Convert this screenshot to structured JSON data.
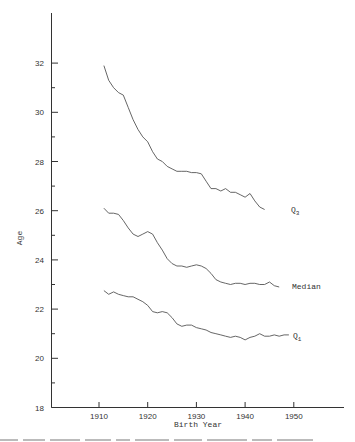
{
  "chart_data": {
    "type": "line",
    "title": "",
    "xlabel": "Birth Year",
    "ylabel": "Age",
    "xlim": [
      1902,
      1961
    ],
    "ylim": [
      18,
      34
    ],
    "x_ticks": [
      1910,
      1920,
      1930,
      1940,
      1950
    ],
    "y_ticks": [
      18,
      20,
      22,
      24,
      26,
      28,
      30,
      32
    ],
    "y_minor_ticks": [
      19,
      21,
      23,
      25,
      27,
      29,
      31
    ],
    "grid": false,
    "legend": "inline labels at right end of each series",
    "series": [
      {
        "name": "Q3",
        "label_main": "Q",
        "label_sub": "3",
        "x_start": 1911,
        "values": [
          31.9,
          31.3,
          31.0,
          30.8,
          30.7,
          30.2,
          29.7,
          29.3,
          29.0,
          28.8,
          28.4,
          28.1,
          28.0,
          27.8,
          27.7,
          27.6,
          27.6,
          27.6,
          27.55,
          27.55,
          27.5,
          27.2,
          26.9,
          26.9,
          26.8,
          26.9,
          26.75,
          26.75,
          26.65,
          26.55,
          26.7,
          26.4,
          26.15,
          26.05
        ]
      },
      {
        "name": "Median",
        "label_main": "Median",
        "label_sub": "",
        "x_start": 1911,
        "values": [
          26.1,
          25.9,
          25.9,
          25.85,
          25.6,
          25.3,
          25.05,
          24.95,
          25.05,
          25.15,
          25.05,
          24.7,
          24.4,
          24.05,
          23.85,
          23.75,
          23.75,
          23.7,
          23.75,
          23.8,
          23.75,
          23.65,
          23.45,
          23.2,
          23.1,
          23.05,
          23.0,
          23.05,
          23.05,
          23.0,
          23.05,
          23.05,
          23.0,
          23.0,
          23.1,
          22.95,
          22.9
        ]
      },
      {
        "name": "Q1",
        "label_main": "Q",
        "label_sub": "1",
        "x_start": 1911,
        "values": [
          22.75,
          22.6,
          22.7,
          22.6,
          22.55,
          22.5,
          22.5,
          22.4,
          22.3,
          22.15,
          21.9,
          21.85,
          21.9,
          21.85,
          21.65,
          21.4,
          21.3,
          21.35,
          21.35,
          21.25,
          21.2,
          21.15,
          21.05,
          21.0,
          20.95,
          20.9,
          20.85,
          20.9,
          20.85,
          20.75,
          20.85,
          20.9,
          21.0,
          20.9,
          20.9,
          20.95,
          20.9,
          20.95,
          20.95
        ]
      }
    ]
  },
  "colors": {
    "line": "#555555",
    "axis": "#333333",
    "text": "#333333",
    "background": "#ffffff"
  }
}
